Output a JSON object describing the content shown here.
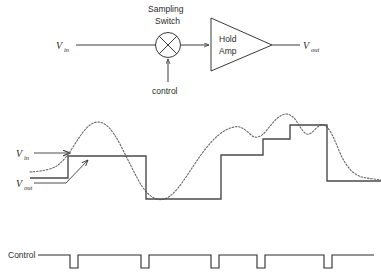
{
  "figure": {
    "stroke_color": "#3a3a3a",
    "signal_color": "#4a4a4a",
    "input_color": "#6a6a6a",
    "background": "#ffffff"
  },
  "block_diagram": {
    "input_label": {
      "base": "V",
      "sub": "in"
    },
    "output_label": {
      "base": "V",
      "sub": "out"
    },
    "switch_label_line1": "Sampling",
    "switch_label_line2": "Switch",
    "control_label": "control",
    "amp_label_line1": "Hold",
    "amp_label_line2": "Amp"
  },
  "waveform": {
    "input_label": {
      "base": "V",
      "sub": "in"
    },
    "output_label": {
      "base": "V",
      "sub": "out"
    },
    "control_label": "Control"
  },
  "chart_data": {
    "type": "line",
    "xlabel": "",
    "ylabel": "",
    "xlim": [
      30,
      381
    ],
    "ylim": [
      205,
      110
    ],
    "grid": false,
    "legend_position": "left-inline",
    "series": [
      {
        "name": "Vin",
        "style": "dotted",
        "color": "#6a6a6a",
        "points": [
          [
            30,
            172
          ],
          [
            42,
            171
          ],
          [
            54,
            168
          ],
          [
            62,
            162
          ],
          [
            70,
            152
          ],
          [
            78,
            139
          ],
          [
            86,
            128
          ],
          [
            94,
            122
          ],
          [
            102,
            122
          ],
          [
            110,
            128
          ],
          [
            118,
            140
          ],
          [
            126,
            156
          ],
          [
            134,
            172
          ],
          [
            142,
            187
          ],
          [
            150,
            196
          ],
          [
            158,
            200
          ],
          [
            166,
            199
          ],
          [
            174,
            193
          ],
          [
            182,
            183
          ],
          [
            190,
            171
          ],
          [
            198,
            159
          ],
          [
            206,
            148
          ],
          [
            214,
            139
          ],
          [
            222,
            132
          ],
          [
            230,
            128
          ],
          [
            238,
            126
          ],
          [
            246,
            130
          ],
          [
            254,
            138
          ],
          [
            262,
            136
          ],
          [
            270,
            126
          ],
          [
            278,
            117
          ],
          [
            286,
            113
          ],
          [
            294,
            117
          ],
          [
            300,
            127
          ],
          [
            306,
            135
          ],
          [
            312,
            133
          ],
          [
            318,
            126
          ],
          [
            324,
            124
          ],
          [
            330,
            130
          ],
          [
            336,
            143
          ],
          [
            342,
            158
          ],
          [
            350,
            170
          ],
          [
            358,
            176
          ],
          [
            366,
            178
          ],
          [
            374,
            179
          ],
          [
            381,
            180
          ]
        ]
      },
      {
        "name": "Vout",
        "style": "staircase",
        "color": "#4a4a4a",
        "steps": [
          {
            "x_start": 30,
            "x_end": 68,
            "y": 178
          },
          {
            "x_start": 68,
            "x_end": 146,
            "y": 156
          },
          {
            "x_start": 146,
            "x_end": 221,
            "y": 199
          },
          {
            "x_start": 221,
            "x_end": 263,
            "y": 155
          },
          {
            "x_start": 263,
            "x_end": 290,
            "y": 139
          },
          {
            "x_start": 290,
            "x_end": 327,
            "y": 125
          },
          {
            "x_start": 327,
            "x_end": 381,
            "y": 181
          }
        ]
      },
      {
        "name": "Control",
        "style": "pulse",
        "color": "#2a2a2a",
        "baseline_y": 255,
        "pulse_low_y": 268,
        "x_start": 38,
        "x_end": 374,
        "pulses": [
          {
            "x_start": 70,
            "x_end": 78
          },
          {
            "x_start": 141,
            "x_end": 149
          },
          {
            "x_start": 211,
            "x_end": 219
          },
          {
            "x_start": 257,
            "x_end": 265
          },
          {
            "x_start": 324,
            "x_end": 332
          }
        ]
      }
    ]
  }
}
